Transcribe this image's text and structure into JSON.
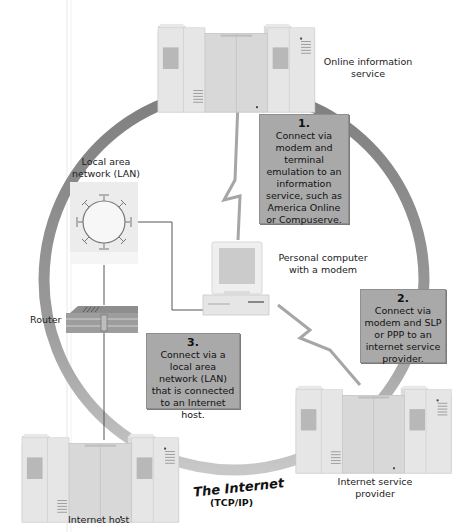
{
  "diagram": {
    "title_ring": {
      "label": "The Internet",
      "sublabel": "(TCP/IP)"
    },
    "nodes": {
      "online_service": {
        "label_line1": "Online information",
        "label_line2": "service"
      },
      "lan": {
        "label_line1": "Local area",
        "label_line2": "network (LAN)"
      },
      "router": {
        "label": "Router"
      },
      "pc": {
        "label_line1": "Personal computer",
        "label_line2": "with a modem"
      },
      "isp": {
        "label_line1": "Internet service",
        "label_line2": "provider"
      },
      "host": {
        "label": "Internet host"
      }
    },
    "steps": [
      {
        "number": "1.",
        "lines": [
          "Connect via",
          "modem and",
          "terminal",
          "emulation to an",
          "information",
          "service, such as",
          "America Online",
          "or Compuserve."
        ]
      },
      {
        "number": "2.",
        "lines": [
          "Connect via",
          "modem and SLP",
          "or PPP to an",
          "internet service",
          "provider."
        ]
      },
      {
        "number": "3.",
        "lines": [
          "Connect via a",
          "local area",
          "network (LAN)",
          "that is connected",
          "to an Internet host."
        ]
      }
    ],
    "colors": {
      "ring": "#8c8c8c",
      "ring_light": "#c4c4c4",
      "step_box": "#a9a9a9",
      "server_body": "#e4e4e4",
      "server_shade": "#cfcfcf",
      "line": "#555555"
    }
  }
}
